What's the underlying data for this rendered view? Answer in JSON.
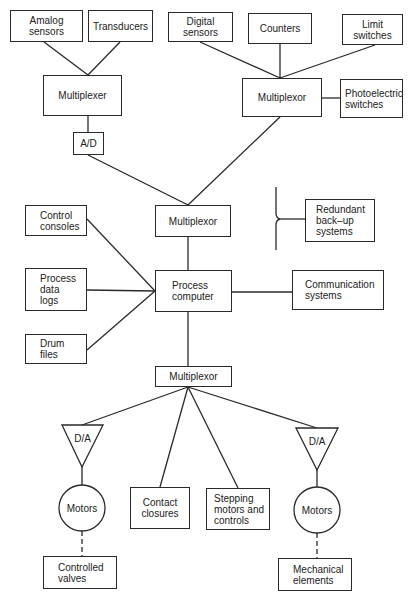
{
  "diagram": {
    "title": "",
    "nodes": {
      "analog_sensors": "Amalog\nsensors",
      "transducers": "Transducers",
      "digital_sensors": "Digital\nsensors",
      "counters": "Counters",
      "limit_switches": "Limit\nswitches",
      "multiplexer_left": "Multiplexer",
      "multiplexor_right": "Multiplexor",
      "photoelectric_switches": "Photoelectric\nswitches",
      "ad_converter": "A/D",
      "multiplexor_middle": "Multiplexor",
      "redundant_backup": "Redundant\nback–up\nsystems",
      "control_consoles": "Control\nconsoles",
      "process_data_logs": "Process\ndata\nlogs",
      "drum_files": "Drum\nfiles",
      "process_computer": "Process\ncomputer",
      "communication_systems": "Communication\nsystems",
      "multiplexor_bottom": "Multiplexor",
      "da_left": "D/A",
      "motors_left": "Motors",
      "contact_closures": "Contact\nclosures",
      "stepping_motors": "Stepping\nmotors and\ncontrols",
      "da_right": "D/A",
      "motors_right": "Motors",
      "controlled_valves": "Controlled\nvalves",
      "mechanical_elements": "Mechanical\nelements"
    },
    "edges": [
      [
        "analog_sensors",
        "multiplexer_left"
      ],
      [
        "transducers",
        "multiplexer_left"
      ],
      [
        "multiplexer_left",
        "ad_converter"
      ],
      [
        "digital_sensors",
        "multiplexor_right"
      ],
      [
        "counters",
        "multiplexor_right"
      ],
      [
        "limit_switches",
        "multiplexor_right"
      ],
      [
        "photoelectric_switches",
        "multiplexor_right"
      ],
      [
        "ad_converter",
        "multiplexor_middle"
      ],
      [
        "multiplexor_right",
        "multiplexor_middle"
      ],
      [
        "multiplexor_middle",
        "process_computer"
      ],
      [
        "control_consoles",
        "process_computer"
      ],
      [
        "process_data_logs",
        "process_computer"
      ],
      [
        "drum_files",
        "process_computer"
      ],
      [
        "process_computer",
        "communication_systems"
      ],
      [
        "process_computer",
        "multiplexor_bottom"
      ],
      [
        "multiplexor_bottom",
        "da_left"
      ],
      [
        "multiplexor_bottom",
        "contact_closures"
      ],
      [
        "multiplexor_bottom",
        "stepping_motors"
      ],
      [
        "multiplexor_bottom",
        "da_right"
      ],
      [
        "da_left",
        "motors_left"
      ],
      [
        "da_right",
        "motors_right"
      ],
      [
        "motors_left",
        "controlled_valves",
        "dashed"
      ],
      [
        "motors_right",
        "mechanical_elements",
        "dashed"
      ],
      [
        "redundant_backup",
        "bracket"
      ]
    ],
    "colors": {
      "line": "#2a2a2a",
      "background": "#ffffff"
    }
  }
}
